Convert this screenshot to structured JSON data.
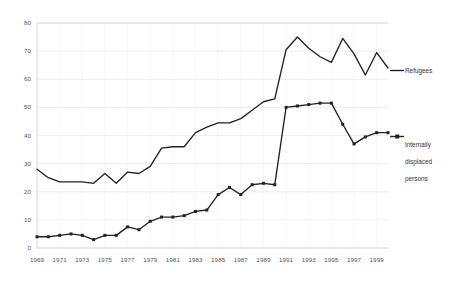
{
  "chart_data": {
    "type": "line",
    "title": "",
    "subtitle": "",
    "xlabel": "",
    "ylabel": "",
    "xlim": [
      1969,
      2000
    ],
    "ylim": [
      0,
      80
    ],
    "grid": true,
    "legend_position": "right",
    "x": [
      1969,
      1970,
      1971,
      1972,
      1973,
      1974,
      1975,
      1976,
      1977,
      1978,
      1979,
      1980,
      1981,
      1982,
      1983,
      1984,
      1985,
      1986,
      1987,
      1988,
      1989,
      1990,
      1991,
      1992,
      1993,
      1994,
      1995,
      1996,
      1997,
      1998,
      1999,
      2000
    ],
    "xticklabels": [
      "1969",
      "1971",
      "1973",
      "1975",
      "1977",
      "1979",
      "1981",
      "1983",
      "1985",
      "1987",
      "1989",
      "1991",
      "1993",
      "1995",
      "1997",
      "1999"
    ],
    "xtickvalues": [
      1969,
      1971,
      1973,
      1975,
      1977,
      1979,
      1981,
      1983,
      1985,
      1987,
      1989,
      1991,
      1993,
      1995,
      1997,
      1999
    ],
    "yticklabels": [
      "0",
      "10",
      "20",
      "30",
      "40",
      "50",
      "60",
      "70",
      "80"
    ],
    "ytickvalues": [
      0,
      10,
      20,
      30,
      40,
      50,
      60,
      70,
      80
    ],
    "series": [
      {
        "name": "Refugees",
        "marker": "none",
        "color": "#222222",
        "values": [
          28.0,
          25.0,
          23.5,
          23.5,
          23.5,
          23.0,
          26.5,
          23.0,
          27.0,
          26.5,
          29.0,
          35.5,
          36.0,
          36.0,
          41.0,
          43.0,
          44.5,
          44.5,
          46.0,
          49.0,
          52.0,
          53.0,
          70.5,
          75.0,
          71.0,
          68.0,
          66.0,
          74.5,
          69.0,
          61.5,
          69.5,
          64.0
        ]
      },
      {
        "name": "Internally displaced persons",
        "marker": "square",
        "color": "#222222",
        "values": [
          4.0,
          4.0,
          4.5,
          5.0,
          4.5,
          3.0,
          4.5,
          4.5,
          7.5,
          6.5,
          9.5,
          11.0,
          11.0,
          11.5,
          13.0,
          13.5,
          19.0,
          21.5,
          19.0,
          22.5,
          23.0,
          22.5,
          50.0,
          50.5,
          51.0,
          51.5,
          51.5,
          44.0,
          37.0,
          39.5,
          41.0,
          41.0
        ]
      }
    ],
    "legend": [
      {
        "label": "Refugees",
        "marker": "none"
      },
      {
        "label": "Internally displaced persons",
        "marker": "square"
      }
    ]
  },
  "legend_text": {
    "refugees": "Refugees",
    "idp_line1": "Internally",
    "idp_line2": "displaced",
    "idp_line3": "persons"
  },
  "colors": {
    "series": "#222222",
    "grid": "#e9e9e9",
    "axis": "#d8d8d8",
    "tick_text": "#555555",
    "background": "#ffffff"
  }
}
